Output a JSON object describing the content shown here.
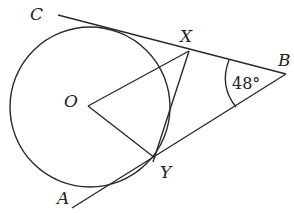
{
  "diagram": {
    "type": "geometry-tangents-to-circle",
    "labels": {
      "C": "C",
      "X": "X",
      "B": "B",
      "O": "O",
      "Y": "Y",
      "A": "A"
    },
    "angle_label": "48°",
    "stroke_color": "#2a2a2a",
    "background": "#ffffff"
  }
}
